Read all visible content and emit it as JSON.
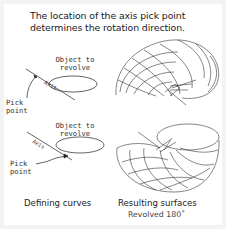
{
  "title": {
    "line1": "The location of the axis pick point",
    "line2": "determines the rotation direction."
  },
  "top_example": {
    "object_label_line1": "Object to",
    "object_label_line2": "revolve",
    "axis_label": "Axis",
    "pick_label_line1": "Pick",
    "pick_label_line2": "point"
  },
  "bottom_example": {
    "object_label_line1": "Object to",
    "object_label_line2": "revolve",
    "axis_label": "Axis",
    "pick_label_line1": "Pick",
    "pick_label_line2": "point"
  },
  "captions": {
    "left": "Defining curves",
    "right": "Resulting surfaces",
    "right_sub": "Revolved  180˚"
  },
  "colors": {
    "background": "#f3f3f3",
    "panel": "#ffffff",
    "line": "#222222"
  }
}
